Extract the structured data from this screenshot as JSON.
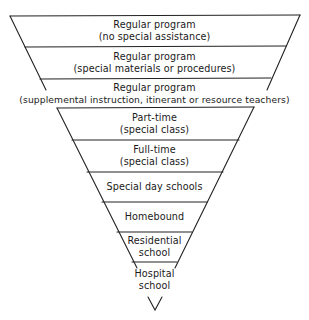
{
  "diagram": {
    "type": "inverted-triangle-cascade",
    "line_color": "#222222",
    "levels": [
      {
        "id": "level-1",
        "line1": "Regular program",
        "line2": "(no special assistance)"
      },
      {
        "id": "level-2",
        "line1": "Regular program",
        "line2": "(special materials or procedures)"
      },
      {
        "id": "level-3",
        "line1": "Regular program",
        "line2": "(supplemental instruction, itinerant or resource teachers)"
      },
      {
        "id": "level-4",
        "line1": "Part-time",
        "line2": "(special class)"
      },
      {
        "id": "level-5",
        "line1": "Full-time",
        "line2": "(special class)"
      },
      {
        "id": "level-6",
        "line1": "Special day schools",
        "line2": ""
      },
      {
        "id": "level-7",
        "line1": "Homebound",
        "line2": ""
      },
      {
        "id": "level-8",
        "line1": "Residential",
        "line2": "school"
      },
      {
        "id": "level-9",
        "line1": "Hospital",
        "line2": "school"
      }
    ]
  }
}
